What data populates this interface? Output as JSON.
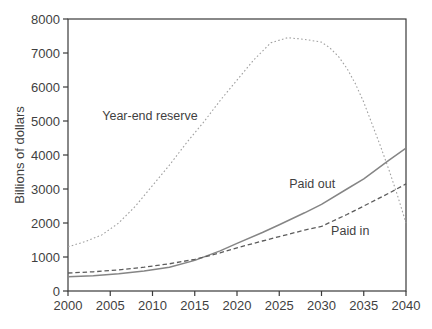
{
  "figure": {
    "background_color": "#ffffff",
    "axis_color": "#3a3a3a",
    "text_color": "#3f3f3f"
  },
  "chart_data": {
    "type": "line",
    "title": "",
    "xlabel": "",
    "ylabel": "Billions of dollars",
    "xlim": [
      2000,
      2040
    ],
    "ylim": [
      0,
      8000
    ],
    "x_ticks": [
      2000,
      2005,
      2010,
      2015,
      2020,
      2025,
      2030,
      2035,
      2040
    ],
    "y_ticks": [
      0,
      1000,
      2000,
      3000,
      4000,
      5000,
      6000,
      7000,
      8000
    ],
    "grid": false,
    "frame": true,
    "legend_position": "inline-annotations",
    "series": [
      {
        "name": "Year-end reserve",
        "style": "dotted",
        "color": "#a0a0a0",
        "width": 1.1,
        "points": [
          [
            2000,
            1300
          ],
          [
            2002,
            1450
          ],
          [
            2004,
            1650
          ],
          [
            2006,
            2000
          ],
          [
            2008,
            2500
          ],
          [
            2010,
            3100
          ],
          [
            2012,
            3700
          ],
          [
            2014,
            4350
          ],
          [
            2016,
            4950
          ],
          [
            2018,
            5600
          ],
          [
            2020,
            6200
          ],
          [
            2022,
            6800
          ],
          [
            2024,
            7300
          ],
          [
            2026,
            7450
          ],
          [
            2028,
            7400
          ],
          [
            2030,
            7320
          ],
          [
            2031,
            7150
          ],
          [
            2032,
            6900
          ],
          [
            2033,
            6550
          ],
          [
            2034,
            6100
          ],
          [
            2035,
            5550
          ],
          [
            2036,
            4900
          ],
          [
            2037,
            4250
          ],
          [
            2038,
            3550
          ],
          [
            2039,
            2800
          ],
          [
            2040,
            2000
          ]
        ]
      },
      {
        "name": "Paid out",
        "style": "solid",
        "color": "#858585",
        "width": 1.5,
        "points": [
          [
            2000,
            420
          ],
          [
            2003,
            450
          ],
          [
            2006,
            510
          ],
          [
            2009,
            590
          ],
          [
            2012,
            700
          ],
          [
            2015,
            900
          ],
          [
            2018,
            1180
          ],
          [
            2020,
            1400
          ],
          [
            2023,
            1720
          ],
          [
            2025,
            1950
          ],
          [
            2028,
            2300
          ],
          [
            2030,
            2550
          ],
          [
            2033,
            3000
          ],
          [
            2035,
            3300
          ],
          [
            2038,
            3850
          ],
          [
            2040,
            4200
          ]
        ]
      },
      {
        "name": "Paid in",
        "style": "dashed",
        "color": "#5c5c5c",
        "width": 1.3,
        "points": [
          [
            2000,
            530
          ],
          [
            2003,
            565
          ],
          [
            2006,
            620
          ],
          [
            2009,
            700
          ],
          [
            2012,
            800
          ],
          [
            2015,
            930
          ],
          [
            2018,
            1120
          ],
          [
            2020,
            1270
          ],
          [
            2023,
            1470
          ],
          [
            2025,
            1600
          ],
          [
            2028,
            1790
          ],
          [
            2030,
            1900
          ],
          [
            2033,
            2250
          ],
          [
            2035,
            2500
          ],
          [
            2038,
            2880
          ],
          [
            2040,
            3150
          ]
        ]
      }
    ],
    "annotations": [
      {
        "text": "Year-end reserve",
        "year": 2009.7,
        "value": 5020
      },
      {
        "text": "Paid out",
        "year": 2028.9,
        "value": 3020
      },
      {
        "text": "Paid in",
        "year": 2033.4,
        "value": 1640
      }
    ]
  }
}
